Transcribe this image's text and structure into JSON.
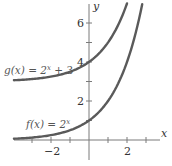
{
  "chart_data": {
    "type": "line",
    "title": "",
    "xlabel": "x",
    "ylabel": "y",
    "xlim": [
      -3.95,
      3.3
    ],
    "ylim": [
      -0.7,
      7
    ],
    "grid": false,
    "x_ticks": [
      -3,
      -2,
      -1,
      0,
      1,
      2,
      3
    ],
    "x_tick_labels": [
      {
        "value": -2,
        "label": "−2"
      },
      {
        "value": 2,
        "label": "2"
      }
    ],
    "y_ticks": [
      1,
      2,
      3,
      4,
      5,
      6
    ],
    "y_tick_labels": [
      {
        "value": 2,
        "label": "2"
      },
      {
        "value": 4,
        "label": "4"
      },
      {
        "value": 6,
        "label": "6"
      }
    ],
    "series": [
      {
        "name": "f(x) = 2^x",
        "label_text": "f(x) = 2",
        "label_exponent": "x",
        "formula": "2^x",
        "x": [
          -3.95,
          -3,
          -2,
          -1,
          0,
          1,
          2,
          2.5,
          2.8
        ],
        "values": [
          0.065,
          0.125,
          0.25,
          0.5,
          1,
          2,
          4,
          5.66,
          6.96
        ],
        "color": "#5a5a5a"
      },
      {
        "name": "g(x) = 2^x + 3",
        "label_text": "g(x) = 2",
        "label_exponent": "x",
        "label_suffix": " + 3",
        "formula": "2^x + 3",
        "x": [
          -3.95,
          -3,
          -2,
          -1,
          0,
          1,
          1.5,
          2
        ],
        "values": [
          3.065,
          3.125,
          3.25,
          3.5,
          4,
          5,
          5.83,
          7
        ],
        "color": "#5a5a5a"
      }
    ]
  },
  "axes": {
    "x_label": "x",
    "y_label": "y"
  }
}
